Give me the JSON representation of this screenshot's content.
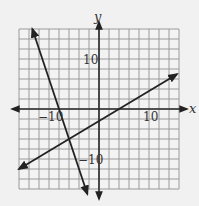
{
  "chart_data": {
    "type": "line",
    "title": "",
    "xlabel": "x",
    "ylabel": "y",
    "xlim": [
      -16,
      16
    ],
    "ylim": [
      -16,
      16
    ],
    "grid": true,
    "grid_step": 2,
    "tick_labels": {
      "x": [
        {
          "value": -10,
          "label": "−10"
        },
        {
          "value": 10,
          "label": "10"
        }
      ],
      "y": [
        {
          "value": 10,
          "label": "10"
        },
        {
          "value": -10,
          "label": "−10"
        }
      ]
    },
    "series": [
      {
        "name": "steep line",
        "equation": "y = -3x - 24",
        "slope": -3,
        "intercept": -24,
        "points": [
          [
            -13.33,
            16
          ],
          [
            -8,
            0
          ],
          [
            -6,
            -6
          ],
          [
            -2.33,
            -17
          ]
        ]
      },
      {
        "name": "shallow line",
        "equation": "y = 0.6x - 2.4",
        "slope": 0.6,
        "intercept": -2.4,
        "points": [
          [
            -16,
            -12
          ],
          [
            -6,
            -6
          ],
          [
            4,
            0
          ],
          [
            15.6,
            6.96
          ]
        ]
      }
    ],
    "intersection": [
      -6,
      -6
    ],
    "colors": {
      "background": "#f1f1f1",
      "grid": "#9a9a9a",
      "axis": "#2a2a2a",
      "line": "#222222"
    }
  }
}
